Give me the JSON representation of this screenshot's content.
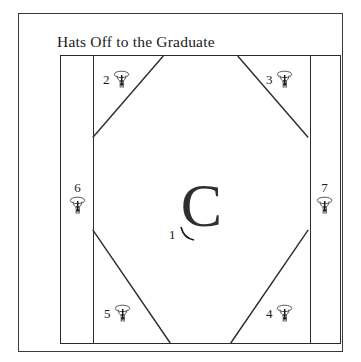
{
  "block": {
    "title": "Hats Off to the Graduate",
    "center_letter": "C",
    "frame_color": "#3a3a3a",
    "line_color": "#2b2b2b",
    "background_color": "#ffffff"
  },
  "patches": [
    {
      "number": "1",
      "icon": "tassel-icon",
      "position": "center"
    },
    {
      "number": "2",
      "icon": "graduation-cap-icon",
      "position": "top-left"
    },
    {
      "number": "3",
      "icon": "graduation-cap-icon",
      "position": "top-right"
    },
    {
      "number": "4",
      "icon": "graduation-cap-icon",
      "position": "bottom-right"
    },
    {
      "number": "5",
      "icon": "graduation-cap-icon",
      "position": "bottom-left"
    },
    {
      "number": "6",
      "icon": "graduation-cap-icon",
      "position": "left"
    },
    {
      "number": "7",
      "icon": "graduation-cap-icon",
      "position": "right"
    }
  ]
}
